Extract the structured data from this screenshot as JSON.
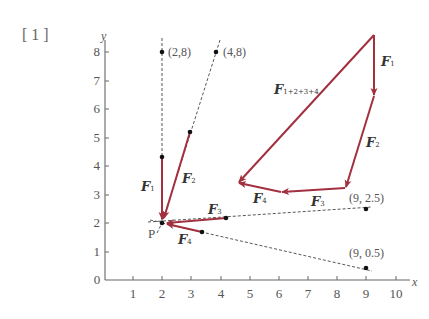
{
  "problem_number": "[1]",
  "axes": {
    "x_label": "x",
    "y_label": "y",
    "x_ticks": [
      "0",
      "1",
      "2",
      "3",
      "4",
      "5",
      "6",
      "7",
      "8",
      "9",
      "10"
    ],
    "y_ticks": [
      "0",
      "1",
      "2",
      "3",
      "4",
      "5",
      "6",
      "7",
      "8"
    ]
  },
  "point_labels": {
    "p": "P",
    "a": "(2,8)",
    "b": "(4,8)",
    "c": "(9, 2.5)",
    "d": "(9, 0.5)"
  },
  "force_labels": {
    "f1_left": {
      "main": "F",
      "sub": "1"
    },
    "f2_left": {
      "main": "F",
      "sub": "2"
    },
    "f3_left": {
      "main": "F",
      "sub": "3"
    },
    "f4_left": {
      "main": "F",
      "sub": "4"
    },
    "f1_right": {
      "main": "F",
      "sub": "1"
    },
    "f2_right": {
      "main": "F",
      "sub": "2"
    },
    "f3_right": {
      "main": "F",
      "sub": "3"
    },
    "f4_right": {
      "main": "F",
      "sub": "4"
    },
    "resultant": {
      "main": "F",
      "sub": "1+2+3+4"
    }
  },
  "colors": {
    "vector": "#a3303f",
    "axis": "#666666",
    "dashed": "#444444",
    "text": "#555555"
  },
  "geometry": {
    "point_P": [
      2,
      2
    ],
    "force_lines": [
      {
        "name": "F1",
        "through": [
          2,
          8
        ],
        "head": [
          2,
          2
        ],
        "tail": [
          2,
          4.3
        ]
      },
      {
        "name": "F2",
        "through": [
          4,
          8
        ],
        "head": [
          2,
          2
        ],
        "tail": [
          2.95,
          5.2
        ]
      },
      {
        "name": "F3",
        "through": [
          9,
          2.5
        ],
        "head": [
          2,
          2
        ],
        "tail": [
          4.2,
          2.15
        ]
      },
      {
        "name": "F4",
        "through": [
          9,
          0.5
        ],
        "head": [
          2,
          2
        ],
        "tail": [
          3.4,
          1.7
        ]
      }
    ],
    "polygon": {
      "description": "Head-to-tail force polygon F1 -> F2 -> F3 -> F4, closing resultant F1+2+3+4",
      "vertices_px": [
        [
          374,
          35
        ],
        [
          374,
          96
        ],
        [
          345,
          188
        ],
        [
          281,
          192
        ],
        [
          238,
          183
        ]
      ]
    }
  }
}
